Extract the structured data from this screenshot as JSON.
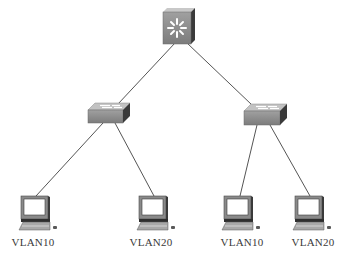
{
  "diagram": {
    "type": "network-topology",
    "colors": {
      "link": "#555555",
      "device_front": "#8e8e8e",
      "device_top": "#c4c4c4",
      "device_side": "#3d3d3d",
      "screen": "#ffffff",
      "label": "#3a3a3a"
    },
    "nodes": [
      {
        "id": "core",
        "kind": "multilayer-switch",
        "x": 177,
        "y": 27,
        "label": ""
      },
      {
        "id": "sw1",
        "kind": "switch",
        "x": 109,
        "y": 113,
        "label": ""
      },
      {
        "id": "sw2",
        "kind": "switch",
        "x": 265,
        "y": 114,
        "label": ""
      },
      {
        "id": "pc1",
        "kind": "pc",
        "x": 35,
        "y": 214,
        "label": "VLAN10"
      },
      {
        "id": "pc2",
        "kind": "pc",
        "x": 153,
        "y": 214,
        "label": "VLAN20"
      },
      {
        "id": "pc3",
        "kind": "pc",
        "x": 238,
        "y": 214,
        "label": "VLAN10"
      },
      {
        "id": "pc4",
        "kind": "pc",
        "x": 309,
        "y": 214,
        "label": "VLAN20"
      }
    ],
    "links": [
      {
        "from": "core",
        "to": "sw1"
      },
      {
        "from": "core",
        "to": "sw2"
      },
      {
        "from": "sw1",
        "to": "pc1"
      },
      {
        "from": "sw1",
        "to": "pc2"
      },
      {
        "from": "sw2",
        "to": "pc3"
      },
      {
        "from": "sw2",
        "to": "pc4"
      }
    ]
  },
  "labels": {
    "pc1": "VLAN10",
    "pc2": "VLAN20",
    "pc3": "VLAN10",
    "pc4": "VLAN20"
  }
}
